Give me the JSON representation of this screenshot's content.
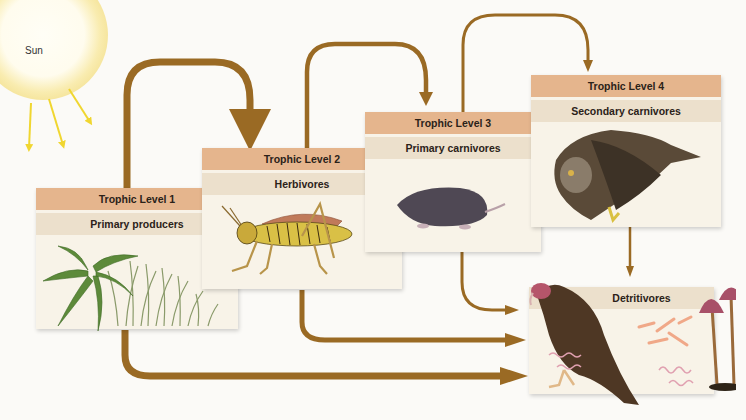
{
  "diagram": {
    "sun": {
      "label": "Sun",
      "ray_color": "#f0d630"
    },
    "arrow_color": "#9a6a24",
    "levels": [
      {
        "level_label": "Trophic Level 1",
        "role": "Primary producers",
        "organism": "fern and grass"
      },
      {
        "level_label": "Trophic Level 2",
        "role": "Herbivores",
        "organism": "grasshopper"
      },
      {
        "level_label": "Trophic Level 3",
        "role": "Primary carnivores",
        "organism": "mole"
      },
      {
        "level_label": "Trophic Level 4",
        "role": "Secondary carnivores",
        "organism": "owl"
      }
    ],
    "detritivores": {
      "role": "Detritivores",
      "organisms": [
        "vulture",
        "bacteria",
        "worms",
        "mushrooms"
      ]
    },
    "flows": [
      {
        "from": "Sun",
        "to": "Trophic Level 1"
      },
      {
        "from": "Trophic Level 1",
        "to": "Trophic Level 2"
      },
      {
        "from": "Trophic Level 2",
        "to": "Trophic Level 3"
      },
      {
        "from": "Trophic Level 3",
        "to": "Trophic Level 4"
      },
      {
        "from": "Trophic Level 1",
        "to": "Detritivores"
      },
      {
        "from": "Trophic Level 2",
        "to": "Detritivores"
      },
      {
        "from": "Trophic Level 3",
        "to": "Detritivores"
      },
      {
        "from": "Trophic Level 4",
        "to": "Detritivores"
      }
    ],
    "colors": {
      "level_band": "#e5b58d",
      "role_band": "#ece0cc",
      "panel_bg": "#f8f3e8"
    }
  }
}
